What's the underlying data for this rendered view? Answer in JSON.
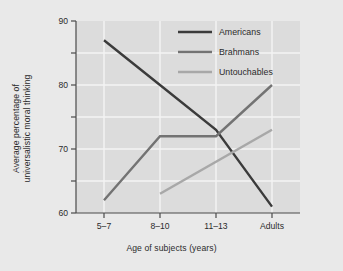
{
  "chart_data": {
    "type": "line",
    "title": "",
    "subtitle": "",
    "xlabel": "Age of subjects (years)",
    "ylabel_line1": "Average percentage of",
    "ylabel_line2": "universalistic moral thinking",
    "categories": [
      "5–7",
      "8–10",
      "11–13",
      "Adults"
    ],
    "ylim": [
      60,
      90
    ],
    "yticks": [
      60,
      70,
      80,
      90
    ],
    "ytick_labels": [
      "60",
      "70",
      "80",
      "90"
    ],
    "yminor_ticks": [
      65,
      75,
      85
    ],
    "grid": "horizontal-and-vertical-white",
    "legend_position": "top-right-inside",
    "series": [
      {
        "name": "Americans",
        "color": "#3b3b3b",
        "x": [
          "5–7",
          "8–10",
          "11–13",
          "Adults"
        ],
        "values": [
          87,
          80,
          73,
          61
        ]
      },
      {
        "name": "Brahmans",
        "color": "#737373",
        "x": [
          "5–7",
          "8–10",
          "11–13",
          "Adults"
        ],
        "values": [
          62,
          72,
          72,
          80
        ]
      },
      {
        "name": "Untouchables",
        "color": "#a8a8a8",
        "x": [
          "8–10",
          "11–13",
          "Adults"
        ],
        "values": [
          63,
          68,
          73
        ]
      }
    ]
  },
  "legend": {
    "entries": [
      {
        "label": "Americans",
        "color": "#3b3b3b"
      },
      {
        "label": "Brahmans",
        "color": "#737373"
      },
      {
        "label": "Untouchables",
        "color": "#a8a8a8"
      }
    ]
  },
  "colors": {
    "figure_background": "#e9e9e9",
    "plot_background": "#dcdcdc",
    "gridline": "#f4f4f4",
    "axis": "#4a4a4a",
    "text": "#2b2b2b"
  }
}
